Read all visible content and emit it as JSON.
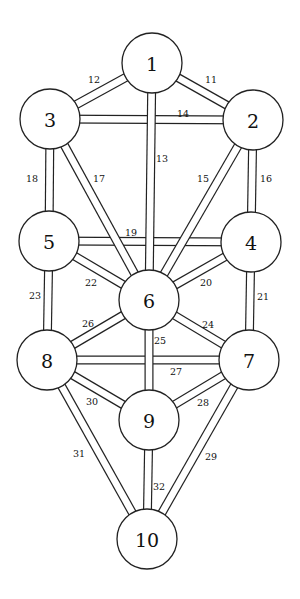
{
  "diagram": {
    "colors": {
      "stroke": "#222222",
      "fill": "#ffffff",
      "text": "#111111"
    },
    "node_radius": 30,
    "path_width": 9,
    "nodes": [
      {
        "id": 1,
        "label": "1",
        "x": 152,
        "y": 63
      },
      {
        "id": 2,
        "label": "2",
        "x": 253,
        "y": 120
      },
      {
        "id": 3,
        "label": "3",
        "x": 50,
        "y": 119
      },
      {
        "id": 4,
        "label": "4",
        "x": 251,
        "y": 242
      },
      {
        "id": 5,
        "label": "5",
        "x": 49,
        "y": 241
      },
      {
        "id": 6,
        "label": "6",
        "x": 149,
        "y": 300
      },
      {
        "id": 7,
        "label": "7",
        "x": 249,
        "y": 360
      },
      {
        "id": 8,
        "label": "8",
        "x": 47,
        "y": 360
      },
      {
        "id": 9,
        "label": "9",
        "x": 149,
        "y": 420
      },
      {
        "id": 10,
        "label": "10",
        "x": 147,
        "y": 539
      }
    ],
    "paths": [
      {
        "number": "14",
        "from": 3,
        "to": 2,
        "label_x": 183,
        "label_y": 113
      },
      {
        "number": "19",
        "from": 5,
        "to": 4,
        "label_x": 131,
        "label_y": 232
      },
      {
        "number": "27",
        "from": 8,
        "to": 7,
        "label_x": 176,
        "label_y": 371
      },
      {
        "number": "12",
        "from": 1,
        "to": 3,
        "label_x": 94,
        "label_y": 79
      },
      {
        "number": "11",
        "from": 1,
        "to": 2,
        "label_x": 211,
        "label_y": 79
      },
      {
        "number": "18",
        "from": 3,
        "to": 5,
        "label_x": 32,
        "label_y": 178
      },
      {
        "number": "16",
        "from": 2,
        "to": 4,
        "label_x": 266,
        "label_y": 178
      },
      {
        "number": "23",
        "from": 5,
        "to": 8,
        "label_x": 35,
        "label_y": 295
      },
      {
        "number": "21",
        "from": 4,
        "to": 7,
        "label_x": 263,
        "label_y": 296
      },
      {
        "number": "17",
        "from": 3,
        "to": 6,
        "label_x": 99,
        "label_y": 178
      },
      {
        "number": "15",
        "from": 2,
        "to": 6,
        "label_x": 203,
        "label_y": 178
      },
      {
        "number": "22",
        "from": 5,
        "to": 6,
        "label_x": 91,
        "label_y": 282
      },
      {
        "number": "20",
        "from": 4,
        "to": 6,
        "label_x": 206,
        "label_y": 282
      },
      {
        "number": "26",
        "from": 8,
        "to": 6,
        "label_x": 88,
        "label_y": 323
      },
      {
        "number": "24",
        "from": 7,
        "to": 6,
        "label_x": 208,
        "label_y": 324
      },
      {
        "number": "30",
        "from": 8,
        "to": 9,
        "label_x": 92,
        "label_y": 401
      },
      {
        "number": "28",
        "from": 7,
        "to": 9,
        "label_x": 203,
        "label_y": 402
      },
      {
        "number": "31",
        "from": 8,
        "to": 10,
        "label_x": 79,
        "label_y": 453
      },
      {
        "number": "29",
        "from": 7,
        "to": 10,
        "label_x": 211,
        "label_y": 456
      },
      {
        "number": "13",
        "from": 1,
        "to": 6,
        "label_x": 162,
        "label_y": 158
      },
      {
        "number": "25",
        "from": 6,
        "to": 9,
        "label_x": 160,
        "label_y": 340
      },
      {
        "number": "32",
        "from": 9,
        "to": 10,
        "label_x": 159,
        "label_y": 486
      }
    ]
  }
}
